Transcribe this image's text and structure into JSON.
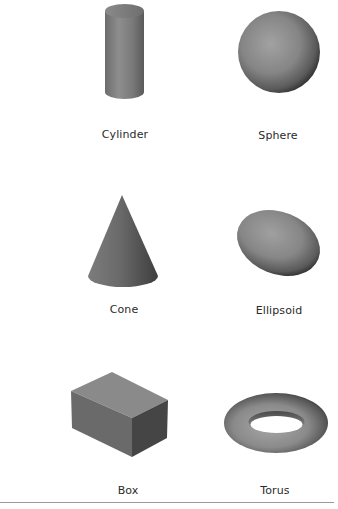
{
  "figure": {
    "title": "",
    "shapes": [
      {
        "name": "cylinder",
        "label": "Cylinder"
      },
      {
        "name": "sphere",
        "label": "Sphere"
      },
      {
        "name": "cone",
        "label": "Cone"
      },
      {
        "name": "ellipsoid",
        "label": "Ellipsoid"
      },
      {
        "name": "box",
        "label": "Box"
      },
      {
        "name": "torus",
        "label": "Torus"
      }
    ],
    "colors": {
      "shape_light": "#9a9a9a",
      "shape_mid": "#7a7a7a",
      "shape_dark": "#3f3f3f",
      "label_text": "#2b2b2b",
      "rule": "#9a9a9a"
    }
  }
}
